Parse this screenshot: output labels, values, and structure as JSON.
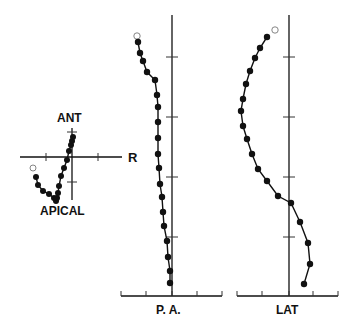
{
  "figure": {
    "panels": [
      {
        "id": "frontal",
        "labels": {
          "top": "ANT",
          "right": "R",
          "bottom": "APICAL"
        }
      },
      {
        "id": "pa",
        "labels": {
          "bottom": "P. A."
        }
      },
      {
        "id": "lat",
        "labels": {
          "bottom": "LAT"
        }
      }
    ]
  },
  "chart_data": [
    {
      "type": "scatter",
      "title": "",
      "panel": "frontal loop",
      "axis_labels": {
        "up": "ANT",
        "right": "R",
        "down": "APICAL"
      },
      "points_px": [
        [
          33,
          168,
          "open"
        ],
        [
          36,
          177
        ],
        [
          38,
          185
        ],
        [
          43,
          191
        ],
        [
          49,
          194
        ],
        [
          54,
          198
        ],
        [
          56,
          201
        ],
        [
          57,
          198
        ],
        [
          58,
          193
        ],
        [
          59,
          186
        ],
        [
          61,
          176
        ],
        [
          64,
          168
        ],
        [
          67,
          160
        ],
        [
          69,
          151
        ],
        [
          71,
          145
        ],
        [
          72,
          141
        ],
        [
          73,
          137
        ]
      ]
    },
    {
      "type": "line",
      "title": "",
      "xlabel": "P. A.",
      "ylabel": "",
      "axis_x_px": 172,
      "ticks_y_px": [
        57,
        117,
        177,
        237
      ],
      "baseline_ticks_x_px": [
        121,
        146,
        172,
        197,
        222
      ],
      "points_px": [
        [
          137,
          36,
          "open"
        ],
        [
          138,
          42
        ],
        [
          140,
          53
        ],
        [
          143,
          61
        ],
        [
          147,
          72
        ],
        [
          155,
          80
        ],
        [
          157,
          95
        ],
        [
          158,
          107
        ],
        [
          158,
          122
        ],
        [
          158,
          138
        ],
        [
          158,
          154
        ],
        [
          159,
          168
        ],
        [
          160,
          184
        ],
        [
          162,
          197
        ],
        [
          163,
          212
        ],
        [
          164,
          226
        ],
        [
          167,
          241
        ],
        [
          168,
          257
        ],
        [
          170,
          271
        ],
        [
          170,
          283
        ]
      ]
    },
    {
      "type": "line",
      "title": "",
      "xlabel": "LAT",
      "ylabel": "",
      "axis_x_px": 289,
      "ticks_y_px": [
        57,
        117,
        177,
        237
      ],
      "baseline_ticks_x_px": [
        237,
        262,
        289,
        313,
        338
      ],
      "points_px": [
        [
          275,
          30,
          "open"
        ],
        [
          267,
          37
        ],
        [
          260,
          48
        ],
        [
          255,
          58
        ],
        [
          250,
          71
        ],
        [
          246,
          84
        ],
        [
          243,
          99
        ],
        [
          241,
          111
        ],
        [
          243,
          126
        ],
        [
          247,
          139
        ],
        [
          252,
          154
        ],
        [
          258,
          169
        ],
        [
          267,
          181
        ],
        [
          278,
          196
        ],
        [
          291,
          203
        ],
        [
          300,
          222
        ],
        [
          308,
          243
        ],
        [
          310,
          264
        ],
        [
          304,
          284
        ]
      ]
    }
  ]
}
